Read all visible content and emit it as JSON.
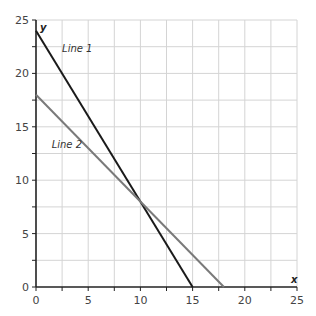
{
  "chart_data": {
    "type": "line",
    "title": "",
    "xlabel": "x",
    "ylabel": "y",
    "xlim": [
      0,
      25
    ],
    "ylim": [
      0,
      25
    ],
    "grid": true,
    "grid_step": 2.5,
    "xticks": [
      0,
      5,
      10,
      15,
      20,
      25
    ],
    "yticks": [
      0,
      5,
      10,
      15,
      20,
      25
    ],
    "xtick_labels": [
      "0",
      "5",
      "10",
      "15",
      "20",
      "25"
    ],
    "ytick_labels": [
      "0",
      "5",
      "10",
      "15",
      "20",
      "25"
    ],
    "series": [
      {
        "name": "Line 1",
        "points": [
          [
            0,
            24
          ],
          [
            15,
            0
          ]
        ],
        "color": "#1a1a1a",
        "label_at": [
          2.5,
          22
        ]
      },
      {
        "name": "Line 2",
        "points": [
          [
            0,
            18
          ],
          [
            18,
            0
          ]
        ],
        "color": "#7a7a7a",
        "label_at": [
          1.5,
          13
        ]
      }
    ],
    "annotations": [
      "Line 1",
      "Line 2"
    ]
  }
}
